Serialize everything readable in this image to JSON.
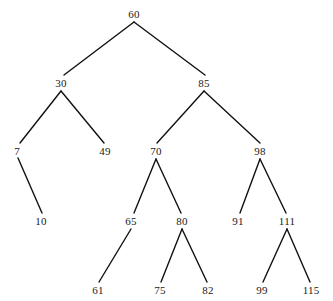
{
  "figure": {
    "name": "binary-search-tree-diagram",
    "background_color": "#ffffff",
    "line_color": "#111111",
    "text_color": "#1a1a1a",
    "width": 333,
    "height": 301
  },
  "chart_data": {
    "type": "diagram",
    "diagram_kind": "binary-search-tree",
    "title": "",
    "nodes": [
      {
        "id": "n60",
        "label": "60",
        "x": 134,
        "y": 14,
        "level": 0,
        "parent": null,
        "side": "root"
      },
      {
        "id": "n30",
        "label": "30",
        "x": 61,
        "y": 83,
        "level": 1,
        "parent": "n60",
        "side": "left"
      },
      {
        "id": "n85",
        "label": "85",
        "x": 204,
        "y": 83,
        "level": 1,
        "parent": "n60",
        "side": "right"
      },
      {
        "id": "n7",
        "label": "7",
        "x": 17,
        "y": 151,
        "level": 2,
        "parent": "n30",
        "side": "left"
      },
      {
        "id": "n49",
        "label": "49",
        "x": 105,
        "y": 151,
        "level": 2,
        "parent": "n30",
        "side": "right"
      },
      {
        "id": "n70",
        "label": "70",
        "x": 156,
        "y": 151,
        "level": 2,
        "parent": "n85",
        "side": "left"
      },
      {
        "id": "n98",
        "label": "98",
        "x": 260,
        "y": 151,
        "level": 2,
        "parent": "n85",
        "side": "right"
      },
      {
        "id": "n10",
        "label": "10",
        "x": 41,
        "y": 221,
        "level": 3,
        "parent": "n7",
        "side": "right"
      },
      {
        "id": "n65",
        "label": "65",
        "x": 131,
        "y": 221,
        "level": 3,
        "parent": "n70",
        "side": "left"
      },
      {
        "id": "n80",
        "label": "80",
        "x": 182,
        "y": 221,
        "level": 3,
        "parent": "n70",
        "side": "right"
      },
      {
        "id": "n91",
        "label": "91",
        "x": 238,
        "y": 221,
        "level": 3,
        "parent": "n98",
        "side": "left"
      },
      {
        "id": "n111",
        "label": "111",
        "x": 287,
        "y": 221,
        "level": 3,
        "parent": "n98",
        "side": "right"
      },
      {
        "id": "n61",
        "label": "61",
        "x": 98,
        "y": 290,
        "level": 4,
        "parent": "n65",
        "side": "left"
      },
      {
        "id": "n75",
        "label": "75",
        "x": 160,
        "y": 290,
        "level": 4,
        "parent": "n80",
        "side": "left"
      },
      {
        "id": "n82",
        "label": "82",
        "x": 208,
        "y": 290,
        "level": 4,
        "parent": "n80",
        "side": "right"
      },
      {
        "id": "n99",
        "label": "99",
        "x": 262,
        "y": 290,
        "level": 4,
        "parent": "n111",
        "side": "left"
      },
      {
        "id": "n115",
        "label": "115",
        "x": 311,
        "y": 290,
        "level": 4,
        "parent": "n111",
        "side": "right"
      }
    ],
    "edges": [
      {
        "from": "n60",
        "to": "n30",
        "x1": 134,
        "y1": 22,
        "x2": 64,
        "y2": 75
      },
      {
        "from": "n60",
        "to": "n85",
        "x1": 134,
        "y1": 22,
        "x2": 205,
        "y2": 75
      },
      {
        "from": "n30",
        "to": "n7",
        "x1": 61,
        "y1": 91,
        "x2": 20,
        "y2": 143
      },
      {
        "from": "n30",
        "to": "n49",
        "x1": 61,
        "y1": 91,
        "x2": 104,
        "y2": 143
      },
      {
        "from": "n85",
        "to": "n70",
        "x1": 204,
        "y1": 91,
        "x2": 157,
        "y2": 143
      },
      {
        "from": "n85",
        "to": "n98",
        "x1": 204,
        "y1": 91,
        "x2": 260,
        "y2": 143
      },
      {
        "from": "n7",
        "to": "n10",
        "x1": 18,
        "y1": 158,
        "x2": 42,
        "y2": 213
      },
      {
        "from": "n70",
        "to": "n65",
        "x1": 156,
        "y1": 159,
        "x2": 134,
        "y2": 213
      },
      {
        "from": "n70",
        "to": "n80",
        "x1": 156,
        "y1": 159,
        "x2": 181,
        "y2": 213
      },
      {
        "from": "n98",
        "to": "n91",
        "x1": 260,
        "y1": 159,
        "x2": 240,
        "y2": 213
      },
      {
        "from": "n98",
        "to": "n111",
        "x1": 260,
        "y1": 159,
        "x2": 286,
        "y2": 213
      },
      {
        "from": "n65",
        "to": "n61",
        "x1": 131,
        "y1": 229,
        "x2": 99,
        "y2": 282
      },
      {
        "from": "n80",
        "to": "n75",
        "x1": 182,
        "y1": 229,
        "x2": 161,
        "y2": 282
      },
      {
        "from": "n80",
        "to": "n82",
        "x1": 182,
        "y1": 229,
        "x2": 207,
        "y2": 282
      },
      {
        "from": "n111",
        "to": "n99",
        "x1": 287,
        "y1": 229,
        "x2": 263,
        "y2": 282
      },
      {
        "from": "n111",
        "to": "n115",
        "x1": 287,
        "y1": 229,
        "x2": 310,
        "y2": 282
      }
    ]
  }
}
